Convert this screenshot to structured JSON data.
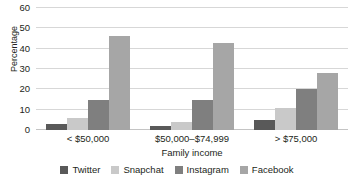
{
  "chart_data": {
    "type": "bar",
    "title": "",
    "xlabel": "Family income",
    "ylabel": "Percentage",
    "categories": [
      "< $50,000",
      "$50,000–$74,999",
      "> $75,000"
    ],
    "series": [
      {
        "name": "Twitter",
        "color": "#595959",
        "values": [
          3,
          2,
          5
        ]
      },
      {
        "name": "Snapchat",
        "color": "#c9c9c9",
        "values": [
          6,
          4,
          11
        ]
      },
      {
        "name": "Instagram",
        "color": "#7f7f7f",
        "values": [
          15,
          15,
          20
        ]
      },
      {
        "name": "Facebook",
        "color": "#a6a6a6",
        "values": [
          46,
          43,
          28
        ]
      }
    ],
    "ylim": [
      0,
      60
    ],
    "yticks": [
      0,
      10,
      20,
      30,
      40,
      50,
      60
    ],
    "ytick_labels": [
      "0",
      "10",
      "20",
      "30",
      "40",
      "50",
      "60"
    ],
    "grid": true,
    "legend_position": "bottom",
    "gridline_color": "#d7d7d7",
    "text_color": "#231f20",
    "background": "#ffffff"
  }
}
